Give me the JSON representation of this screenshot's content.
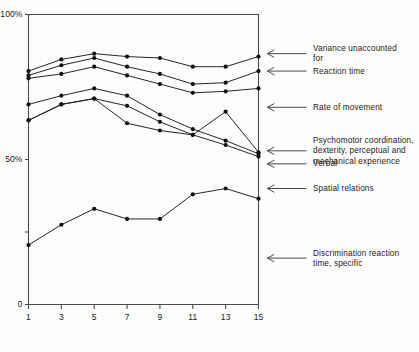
{
  "chart_data": {
    "type": "line",
    "title": "",
    "xlabel": "",
    "ylabel": "",
    "x": [
      1,
      3,
      5,
      7,
      9,
      11,
      13,
      15
    ],
    "xtick_labels": [
      "1",
      "3",
      "5",
      "7",
      "9",
      "11",
      "13",
      "15"
    ],
    "ytick_labels": [
      "100%",
      "50%",
      "0"
    ],
    "ytick_values": [
      100,
      50,
      0
    ],
    "ylim": [
      0,
      100
    ],
    "xlim": [
      1,
      15
    ],
    "grid": false,
    "legend_position": "right-annotations",
    "value_unit": "percent",
    "series": [
      {
        "name": "Variance unaccounted for",
        "values": [
          80.5,
          84.5,
          86.5,
          85.5,
          85.0,
          82.0,
          82.0,
          85.5
        ]
      },
      {
        "name": "Reaction time",
        "values": [
          79.0,
          82.5,
          85.0,
          82.0,
          79.5,
          76.0,
          76.5,
          80.5
        ]
      },
      {
        "name": "Rate of movement",
        "values": [
          78.0,
          79.5,
          82.0,
          79.0,
          76.0,
          73.0,
          73.5,
          74.5
        ]
      },
      {
        "name": "Psychomotor coordination, dexterity, perceptual and mechanical experience",
        "values": [
          69.0,
          72.0,
          74.5,
          72.0,
          65.5,
          60.5,
          56.5,
          52.0
        ]
      },
      {
        "name": "Verbal",
        "values": [
          63.5,
          69.0,
          71.0,
          68.5,
          63.0,
          58.5,
          55.0,
          51.0
        ]
      },
      {
        "name": "Spatial relations",
        "values": [
          63.5,
          69.0,
          71.0,
          62.5,
          60.0,
          58.5,
          66.5,
          52.5
        ]
      },
      {
        "name": "Discrimination reaction time, specific",
        "values": [
          20.5,
          27.5,
          33.0,
          29.5,
          29.5,
          38.0,
          40.0,
          36.5
        ]
      }
    ],
    "annotations": [
      {
        "label": "Variance unaccounted\nfor",
        "anchor_value": 86.5
      },
      {
        "label": "Reaction time",
        "anchor_value": 80.5
      },
      {
        "label": "Rate of movement",
        "anchor_value": 68.0
      },
      {
        "label": "Psychomotor coordination,\ndexterity, perceptual and\nmechanical experience",
        "anchor_value": 53.0
      },
      {
        "label": "Verbal",
        "anchor_value": 48.5
      },
      {
        "label": "Spatial relations",
        "anchor_value": 40.0
      },
      {
        "label": "Discrimination reaction\ntime, specific",
        "anchor_value": 16.0
      }
    ],
    "colors": {
      "line": "#1a1a1a",
      "marker": "#111111",
      "axis": "#4a4a4a",
      "background": "#fdfdfb"
    }
  }
}
